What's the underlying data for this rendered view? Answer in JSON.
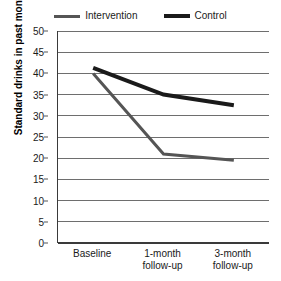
{
  "chart_data": {
    "type": "line",
    "title": "",
    "xlabel": "",
    "ylabel": "Standard drinks in past month",
    "categories": [
      "Baseline",
      "1-month\nfollow-up",
      "3-month\nfollow-up"
    ],
    "xtick_lines": [
      [
        "Baseline",
        ""
      ],
      [
        "1-month",
        "follow-up"
      ],
      [
        "3-month",
        "follow-up"
      ]
    ],
    "ylim": [
      0,
      50
    ],
    "ytick_values": [
      0,
      5,
      10,
      15,
      20,
      25,
      30,
      35,
      40,
      45,
      50
    ],
    "ytick_labels": [
      "0",
      "5",
      "10",
      "15",
      "20",
      "25",
      "30",
      "35",
      "40",
      "45",
      "50"
    ],
    "grid": "horizontal",
    "legend_position": "top-center",
    "series": [
      {
        "name": "Intervention",
        "values": [
          40.0,
          21.0,
          19.5
        ],
        "color": "#555555",
        "linewidth": 3
      },
      {
        "name": "Control",
        "values": [
          41.3,
          35.0,
          32.5
        ],
        "color": "#1a1a1a",
        "linewidth": 4
      }
    ]
  },
  "legend": {
    "entries": [
      {
        "label": "Intervention",
        "swatch_name": "legend-swatch-intervention"
      },
      {
        "label": "Control",
        "swatch_name": "legend-swatch-control"
      }
    ]
  },
  "colors": {
    "intervention": "#555555",
    "control": "#1a1a1a",
    "gridline": "#6e6e6e",
    "axis": "#3a3a3a",
    "background": "#ffffff"
  }
}
